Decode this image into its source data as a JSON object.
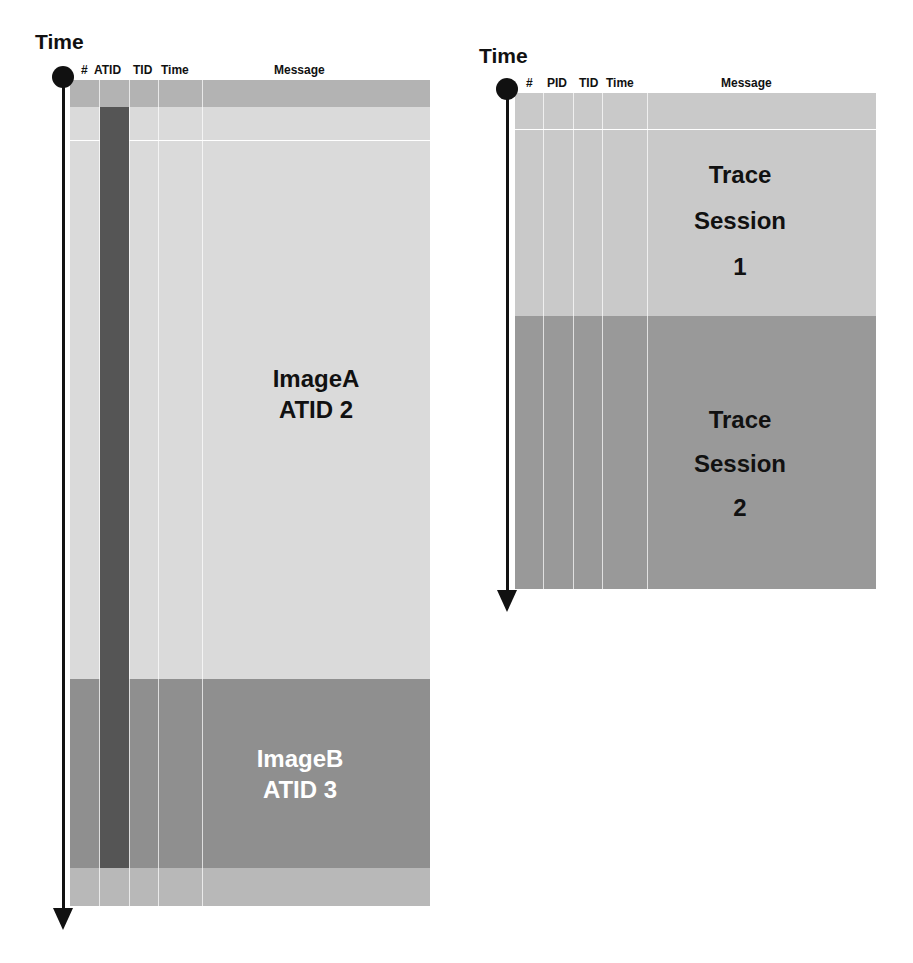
{
  "left_diagram": {
    "axis_label": "Time",
    "columns": [
      "#",
      "ATID",
      "TID",
      "Time",
      "Message"
    ],
    "segments": [
      {
        "label_line1": "ImageA",
        "label_line2": "ATID 2",
        "color": "#d9d9d9",
        "text_color": "#111111"
      },
      {
        "label_line1": "ImageB",
        "label_line2": "ATID 3",
        "color": "#8f8f8f",
        "text_color": "#ffffff"
      }
    ],
    "colors": {
      "header_band": "#b3b3b3",
      "atid_bar": "#555555",
      "footer_band": "#b8b8b8"
    }
  },
  "right_diagram": {
    "axis_label": "Time",
    "columns": [
      "#",
      "PID",
      "TID",
      "Time",
      "Message"
    ],
    "segments": [
      {
        "label_line1": "Trace",
        "label_line2": "Session",
        "label_line3": "1",
        "color": "#c9c9c9",
        "text_color": "#111111"
      },
      {
        "label_line1": "Trace",
        "label_line2": "Session",
        "label_line3": "2",
        "color": "#999999",
        "text_color": "#111111"
      }
    ]
  }
}
